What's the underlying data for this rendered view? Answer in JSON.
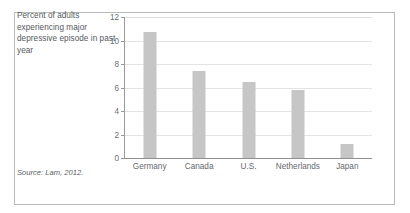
{
  "figure": {
    "caption": "Percent of adults experiencing major depressive episode in past year",
    "source": "Source: Lam, 2012.",
    "frame_color": "#b9b9b9",
    "bar_color": "#c6c6c6",
    "grid_color": "#e3e3e3",
    "axis_color": "#8f8f8f",
    "text_color": "#55595c"
  },
  "chart_data": {
    "type": "bar",
    "title": "Percent of adults experiencing major depressive episode in past year",
    "xlabel": "",
    "ylabel": "",
    "categories": [
      "Germany",
      "Canada",
      "U.S.",
      "Netherlands",
      "Japan"
    ],
    "values": [
      10.7,
      7.4,
      6.5,
      5.8,
      1.2
    ],
    "ylim": [
      0,
      12
    ],
    "yticks": [
      0,
      2,
      4,
      6,
      8,
      10,
      12
    ],
    "ytick_labels": [
      "0",
      "2",
      "4",
      "6",
      "8",
      "10",
      "12"
    ],
    "grid": "horizontal",
    "legend": "none",
    "orientation": "vertical",
    "bar_color": "#c6c6c6",
    "source": "Source: Lam, 2012."
  }
}
